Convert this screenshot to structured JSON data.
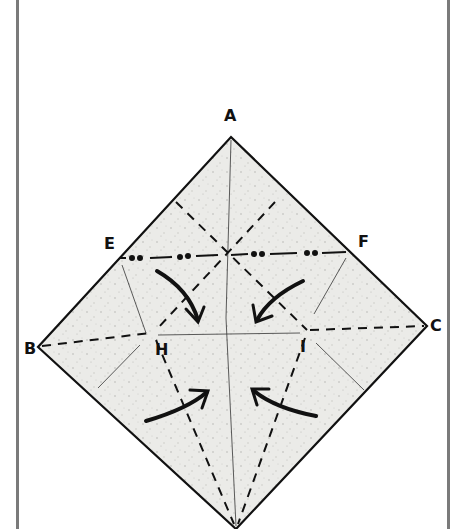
{
  "diagram": {
    "type": "origami-fold-diagram",
    "paper_color": "#e9e9e6",
    "line_color": "#111111",
    "points": {
      "A": {
        "label": "A",
        "x": 231,
        "y": 137
      },
      "B": {
        "label": "B",
        "x": 38,
        "y": 347
      },
      "C": {
        "label": "C",
        "x": 427,
        "y": 326
      },
      "D": {
        "label": "",
        "x": 236,
        "y": 529
      },
      "E": {
        "label": "E",
        "x": 120,
        "y": 258
      },
      "F": {
        "label": "F",
        "x": 348,
        "y": 253
      },
      "H": {
        "label": "H",
        "x": 152,
        "y": 335
      },
      "I": {
        "label": "I",
        "x": 307,
        "y": 332
      }
    },
    "labels": {
      "A": "A",
      "B": "B",
      "C": "C",
      "E": "E",
      "F": "F",
      "H": "H",
      "I": "I"
    },
    "legend": {
      "valley_fold": "dashed line",
      "mountain_fold": "dash-dot-dot line",
      "existing_crease": "thin line",
      "arrows": "fold direction"
    }
  }
}
